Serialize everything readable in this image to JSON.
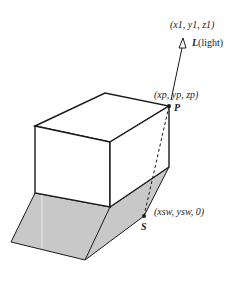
{
  "diagram": {
    "labels": {
      "light_position": "(x1, y1, z1)",
      "light_symbol": "L",
      "light_text": "(light)",
      "point_p_coords": "(xp, yp, zp)",
      "point_p": "P",
      "shadow_point_coords": "(xsw, ysw, 0)",
      "shadow_point": "S"
    },
    "colors": {
      "stroke": "#1a1a1a",
      "shadow_fill": "#c8c8c8",
      "box_fill": "#ffffff"
    }
  }
}
